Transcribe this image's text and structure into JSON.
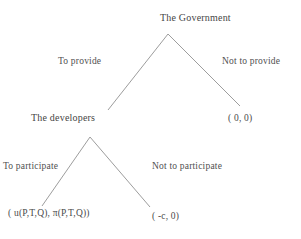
{
  "diagram": {
    "type": "extensive-form-game-tree",
    "nodes": [
      {
        "id": "government",
        "label": "The Government",
        "player": "The Government"
      },
      {
        "id": "developers",
        "label": "The developers",
        "player": "The developers"
      }
    ],
    "edges": [
      {
        "id": "to-provide",
        "label": "To provide",
        "from": "government",
        "to": "developers"
      },
      {
        "id": "not-to-provide",
        "label": "Not to provide",
        "from": "government",
        "to": "payoff-none"
      },
      {
        "id": "to-participate",
        "label": "To participate",
        "from": "developers",
        "to": "payoff-full"
      },
      {
        "id": "not-to-participate",
        "label": "Not to participate",
        "from": "developers",
        "to": "payoff-cost"
      }
    ],
    "payoffs": [
      {
        "id": "payoff-none",
        "text": "( 0,  0)"
      },
      {
        "id": "payoff-full",
        "text": "( u(P,T,Q),   π(P,T,Q))"
      },
      {
        "id": "payoff-cost",
        "text": "( -c,  0)"
      }
    ],
    "colors": {
      "background": "#ffffff",
      "line": "#9a9a9a",
      "text": "#4a4a4a"
    }
  }
}
